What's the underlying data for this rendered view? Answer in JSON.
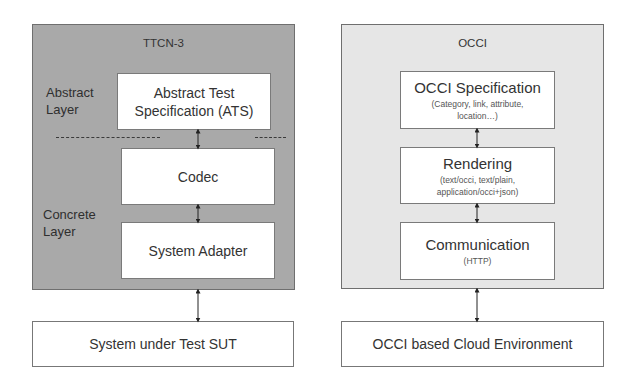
{
  "left": {
    "title": "TTCN-3",
    "layers": {
      "abstract": [
        "Abstract",
        "Layer"
      ],
      "concrete": [
        "Concrete",
        "Layer"
      ]
    },
    "boxes": [
      {
        "lines": [
          "Abstract Test",
          "Specification (ATS)"
        ]
      },
      {
        "lines": [
          "Codec"
        ]
      },
      {
        "lines": [
          "System Adapter"
        ]
      }
    ],
    "target": "System under Test SUT"
  },
  "right": {
    "title": "OCCI",
    "boxes": [
      {
        "main": "OCCI Specification",
        "sub": [
          "(Category, link, attribute,",
          "location…)"
        ]
      },
      {
        "main": "Rendering",
        "sub": [
          "(text/occi, text/plain,",
          "application/occi+json)"
        ]
      },
      {
        "main": "Communication",
        "sub": [
          "(HTTP)"
        ]
      }
    ],
    "target": "OCCI based Cloud Environment"
  },
  "colors": {
    "ttcn_panel": "#a9a9a9",
    "occi_panel": "#e6e6e6",
    "box": "#ffffff",
    "border": "#6f6f6f"
  }
}
